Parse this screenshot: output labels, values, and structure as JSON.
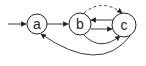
{
  "diagram": {
    "type": "state-diagram",
    "colors": {
      "stroke": "#222222",
      "fill": "#ffffff"
    },
    "nodes": [
      {
        "id": "a",
        "label": "a",
        "cx": 37,
        "cy": 24,
        "r": 10
      },
      {
        "id": "b",
        "label": "b",
        "cx": 80,
        "cy": 24,
        "r": 11
      },
      {
        "id": "c",
        "label": "c",
        "cx": 124,
        "cy": 25,
        "r": 12
      }
    ],
    "edges": [
      {
        "from": "start",
        "to": "a",
        "style": "solid"
      },
      {
        "from": "a",
        "to": "b",
        "style": "solid"
      },
      {
        "from": "b",
        "to": "c",
        "style": "dashed",
        "shape": "arc-over"
      },
      {
        "from": "c",
        "to": "b",
        "style": "solid",
        "shape": "straight-upper"
      },
      {
        "from": "b",
        "to": "c",
        "style": "solid",
        "shape": "straight-lower"
      },
      {
        "from": "b",
        "to": "c",
        "style": "solid",
        "shape": "arc-under"
      },
      {
        "from": "c",
        "to": "a",
        "style": "solid",
        "shape": "arc-under-wide"
      }
    ]
  }
}
